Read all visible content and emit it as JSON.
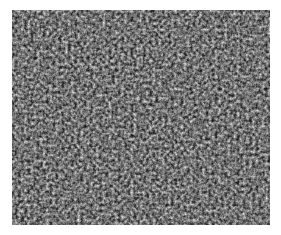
{
  "image": {
    "description": "Grayscale high-frequency granular texture (micrograph-like speckle pattern)",
    "colors": {
      "background": "#ffffff",
      "dark": "#1e1e1e",
      "mid": "#7a7a7a",
      "light": "#f2f2f2"
    },
    "texture": {
      "base_frequency": "0.32",
      "octaves": "3",
      "seed": "7"
    }
  }
}
